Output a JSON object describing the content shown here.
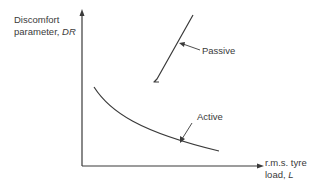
{
  "diagram": {
    "type": "qualitative line diagram",
    "y_axis": {
      "label_line1": "Discomfort",
      "label_line2_prefix": "parameter, ",
      "label_symbol": "DR"
    },
    "x_axis": {
      "label_line1": "r.m.s. tyre",
      "label_line2_prefix": "load, ",
      "label_symbol": "L"
    },
    "curves": [
      {
        "name": "Passive",
        "shape": "steep straight line rising to the right, with small hook at lower end"
      },
      {
        "name": "Active",
        "shape": "decreasing concave-up curve"
      }
    ],
    "colors": {
      "line": "#3a3a3a",
      "text": "#3a3a3a",
      "background": "#ffffff"
    }
  }
}
